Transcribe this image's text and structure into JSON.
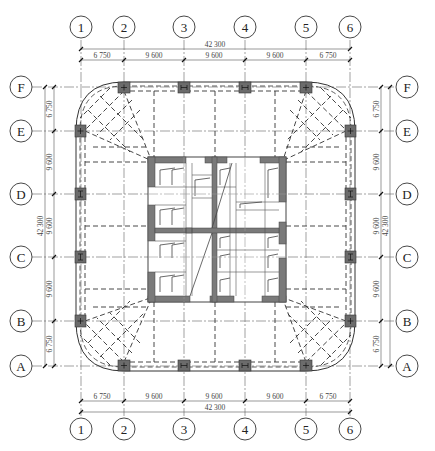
{
  "drawing": {
    "type": "structural floor plan",
    "colors": {
      "background": "#ffffff",
      "line": "#333333",
      "grid_line": "#777777",
      "column_fill": "#6b6b6b",
      "core_wall_fill": "#7a7a7a",
      "dim_line": "#555555"
    }
  },
  "grid": {
    "columns": [
      {
        "label": "1",
        "x": 81
      },
      {
        "label": "2",
        "x": 124
      },
      {
        "label": "3",
        "x": 184
      },
      {
        "label": "4",
        "x": 245
      },
      {
        "label": "5",
        "x": 306
      },
      {
        "label": "6",
        "x": 350
      }
    ],
    "rows": [
      {
        "label": "F",
        "y": 87
      },
      {
        "label": "E",
        "y": 131
      },
      {
        "label": "D",
        "y": 194
      },
      {
        "label": "C",
        "y": 257
      },
      {
        "label": "B",
        "y": 321
      },
      {
        "label": "A",
        "y": 366
      }
    ]
  },
  "dimensions": {
    "top": {
      "overall": "42 300",
      "segments": [
        "6 750",
        "9 600",
        "9 600",
        "9 600",
        "6 750"
      ]
    },
    "bottom": {
      "overall": "42 300",
      "segments": [
        "6 750",
        "9 600",
        "9 600",
        "9 600",
        "6 750"
      ]
    },
    "left": {
      "overall": "42 300",
      "segments": [
        "6 750",
        "9 600",
        "9 600",
        "9 600",
        "6 750"
      ]
    },
    "right": {
      "overall": "42 300",
      "segments": [
        "6 750",
        "9 600",
        "9 600",
        "9 600",
        "6 750"
      ]
    }
  }
}
